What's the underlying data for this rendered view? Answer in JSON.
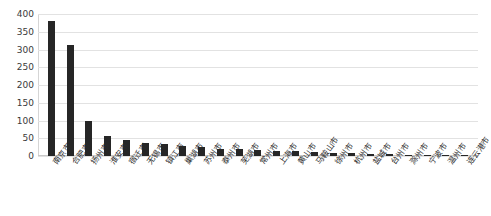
{
  "chart_data": {
    "type": "bar",
    "title": "",
    "subtitle": "",
    "xlabel": "",
    "ylabel": "",
    "ylim": [
      0,
      400
    ],
    "ytick_step": 50,
    "yticks": [
      400,
      350,
      300,
      250,
      200,
      150,
      100,
      50,
      0
    ],
    "grid": true,
    "legend": false,
    "bar_color": "#262626",
    "grid_color": "#e2e2e2",
    "categories": [
      "南京市",
      "合肥市",
      "扬州市",
      "淮安市",
      "宿迁市",
      "无锡市",
      "镇江市",
      "巢湖市",
      "苏州市",
      "泰州市",
      "芜湖市",
      "常州市",
      "上海市",
      "黄山市",
      "马鞍山市",
      "徐州市",
      "杭州市",
      "盐城市",
      "台州市",
      "滁州市",
      "宁波市",
      "温州市",
      "连云港市"
    ],
    "values": [
      380,
      313,
      100,
      56,
      44,
      38,
      33,
      28,
      24,
      21,
      19,
      17,
      15,
      13,
      11,
      9,
      8,
      7,
      6,
      4,
      3,
      2,
      1
    ]
  }
}
